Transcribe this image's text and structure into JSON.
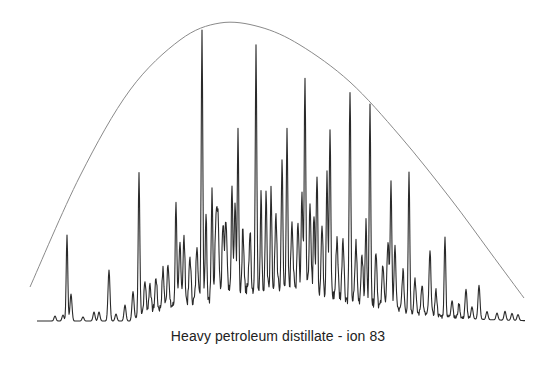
{
  "chart_data": {
    "type": "line",
    "title": "Heavy petroleum distillate - ion 83",
    "xlabel": "",
    "ylabel": "",
    "grid": false,
    "legend": null,
    "axes_visible": false,
    "series": [
      {
        "name": "ion 83 chromatogram",
        "style": "jagged trace with sharp peaks over an unresolved hump",
        "color": "#2a2a2a",
        "baseline_y_px": 321,
        "x_range_px": [
          37,
          525
        ],
        "peaks": [
          {
            "x": 55,
            "height": 5
          },
          {
            "x": 63,
            "height": 6
          },
          {
            "x": 67,
            "height": 86
          },
          {
            "x": 71,
            "height": 27
          },
          {
            "x": 83,
            "height": 4
          },
          {
            "x": 94,
            "height": 9
          },
          {
            "x": 99,
            "height": 9
          },
          {
            "x": 109,
            "height": 51
          },
          {
            "x": 116,
            "height": 7
          },
          {
            "x": 125,
            "height": 16
          },
          {
            "x": 133,
            "height": 28
          },
          {
            "x": 139,
            "height": 144
          },
          {
            "x": 145,
            "height": 30
          },
          {
            "x": 150,
            "height": 27
          },
          {
            "x": 156,
            "height": 32
          },
          {
            "x": 163,
            "height": 38
          },
          {
            "x": 168,
            "height": 45
          },
          {
            "x": 176,
            "height": 106
          },
          {
            "x": 180,
            "height": 60
          },
          {
            "x": 184,
            "height": 65
          },
          {
            "x": 190,
            "height": 45
          },
          {
            "x": 197,
            "height": 58
          },
          {
            "x": 202,
            "height": 269
          },
          {
            "x": 206,
            "height": 90
          },
          {
            "x": 212,
            "height": 103
          },
          {
            "x": 216,
            "height": 78
          },
          {
            "x": 218,
            "height": 75
          },
          {
            "x": 223,
            "height": 68
          },
          {
            "x": 226,
            "height": 72
          },
          {
            "x": 232,
            "height": 106
          },
          {
            "x": 235,
            "height": 90
          },
          {
            "x": 238,
            "height": 156
          },
          {
            "x": 243,
            "height": 62
          },
          {
            "x": 250,
            "height": 58
          },
          {
            "x": 256,
            "height": 241
          },
          {
            "x": 261,
            "height": 95
          },
          {
            "x": 266,
            "height": 96
          },
          {
            "x": 271,
            "height": 99
          },
          {
            "x": 276,
            "height": 72
          },
          {
            "x": 282,
            "height": 131
          },
          {
            "x": 287,
            "height": 154
          },
          {
            "x": 292,
            "height": 72
          },
          {
            "x": 298,
            "height": 70
          },
          {
            "x": 302,
            "height": 105
          },
          {
            "x": 305,
            "height": 219
          },
          {
            "x": 310,
            "height": 80
          },
          {
            "x": 314,
            "height": 82
          },
          {
            "x": 317,
            "height": 121
          },
          {
            "x": 322,
            "height": 67
          },
          {
            "x": 327,
            "height": 126
          },
          {
            "x": 330,
            "height": 165
          },
          {
            "x": 337,
            "height": 60
          },
          {
            "x": 343,
            "height": 62
          },
          {
            "x": 350,
            "height": 212
          },
          {
            "x": 356,
            "height": 58
          },
          {
            "x": 362,
            "height": 50
          },
          {
            "x": 366,
            "height": 82
          },
          {
            "x": 370,
            "height": 196
          },
          {
            "x": 376,
            "height": 55
          },
          {
            "x": 383,
            "height": 44
          },
          {
            "x": 388,
            "height": 68
          },
          {
            "x": 391,
            "height": 129
          },
          {
            "x": 395,
            "height": 60
          },
          {
            "x": 403,
            "height": 40
          },
          {
            "x": 409,
            "height": 142
          },
          {
            "x": 415,
            "height": 35
          },
          {
            "x": 422,
            "height": 30
          },
          {
            "x": 430,
            "height": 63
          },
          {
            "x": 436,
            "height": 25
          },
          {
            "x": 445,
            "height": 82
          },
          {
            "x": 452,
            "height": 18
          },
          {
            "x": 459,
            "height": 14
          },
          {
            "x": 466,
            "height": 28
          },
          {
            "x": 472,
            "height": 12
          },
          {
            "x": 479,
            "height": 34
          },
          {
            "x": 487,
            "height": 8
          },
          {
            "x": 497,
            "height": 7
          },
          {
            "x": 505,
            "height": 9
          },
          {
            "x": 512,
            "height": 7
          },
          {
            "x": 518,
            "height": 6
          }
        ]
      },
      {
        "name": "envelope curve",
        "style": "smooth thin gray arc",
        "color": "#8a8a8a",
        "points_px": [
          [
            30,
            287
          ],
          [
            80,
            176
          ],
          [
            130,
            90
          ],
          [
            180,
            40
          ],
          [
            220,
            23
          ],
          [
            260,
            27
          ],
          [
            300,
            45
          ],
          [
            350,
            82
          ],
          [
            400,
            136
          ],
          [
            450,
            198
          ],
          [
            490,
            252
          ],
          [
            524,
            298
          ]
        ]
      }
    ]
  },
  "caption": {
    "text": "Heavy petroleum distillate - ion 83"
  }
}
